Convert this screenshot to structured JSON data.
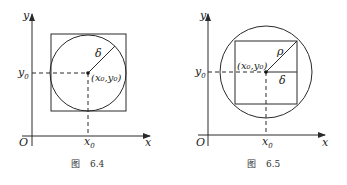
{
  "figures": [
    {
      "caption_prefix": "图",
      "caption_number": "6.4",
      "axis_x_label": "x",
      "axis_y_label": "y",
      "origin_label": "O",
      "x0_label": "x",
      "x0_sub": "0",
      "y0_label": "y",
      "y0_sub": "0",
      "center_label": "(x₀,y₀)",
      "radius_label": "δ",
      "description": "Circle of radius δ centered at (x₀,y₀) inscribed in a square"
    },
    {
      "caption_prefix": "图",
      "caption_number": "6.5",
      "axis_x_label": "x",
      "axis_y_label": "y",
      "origin_label": "O",
      "x0_label": "x",
      "x0_sub": "0",
      "y0_label": "y",
      "y0_sub": "0",
      "center_label": "(x₀,y₀)",
      "radius_label": "ρ",
      "half_side_label": "δ",
      "description": "Square of half-side δ centered at (x₀,y₀) inscribed in a circle of radius ρ"
    }
  ]
}
